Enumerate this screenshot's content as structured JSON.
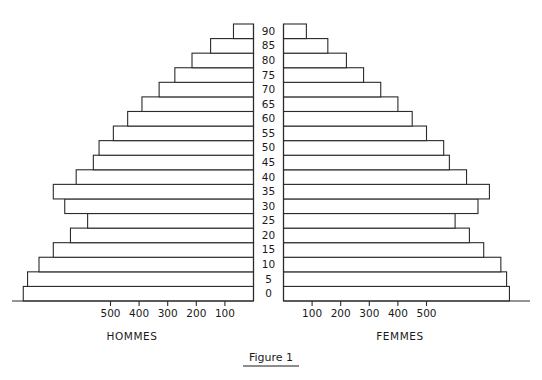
{
  "figure": {
    "caption": "Figure 1",
    "left_group_label": "HOMMES",
    "right_group_label": "FEMMES"
  },
  "chart_data": {
    "type": "bar",
    "subtype": "population-pyramid",
    "title": "Figure 1",
    "xlabel": "",
    "ylabel": "",
    "orientation": "horizontal",
    "grid": false,
    "legend": "none",
    "axis_center_labels": [
      "0",
      "5",
      "10",
      "15",
      "20",
      "25",
      "30",
      "35",
      "40",
      "45",
      "50",
      "55",
      "60",
      "65",
      "70",
      "75",
      "80",
      "85",
      "90"
    ],
    "categories": [
      "0",
      "5",
      "10",
      "15",
      "20",
      "25",
      "30",
      "35",
      "40",
      "45",
      "50",
      "55",
      "60",
      "65",
      "70",
      "75",
      "80",
      "85",
      "90"
    ],
    "left_tick_labels": [
      "500",
      "400",
      "300",
      "200",
      "100"
    ],
    "right_tick_labels": [
      "100",
      "200",
      "300",
      "400",
      "500"
    ],
    "left_tick_values": [
      500,
      400,
      300,
      200,
      100
    ],
    "right_tick_values": [
      100,
      200,
      300,
      400,
      500
    ],
    "xlim": [
      0,
      820
    ],
    "series": [
      {
        "name": "HOMMES",
        "side": "left",
        "values": [
          805,
          790,
          750,
          700,
          640,
          580,
          660,
          700,
          620,
          560,
          540,
          490,
          440,
          390,
          330,
          275,
          215,
          150,
          70
        ]
      },
      {
        "name": "FEMMES",
        "side": "right",
        "values": [
          790,
          780,
          760,
          700,
          650,
          600,
          680,
          720,
          640,
          580,
          560,
          500,
          450,
          400,
          340,
          280,
          220,
          155,
          80
        ]
      }
    ]
  }
}
